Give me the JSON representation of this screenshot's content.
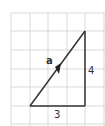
{
  "diagram": {
    "vector_label": "a",
    "vertical_leg_label": "4",
    "horizontal_leg_label": "3",
    "grid": {
      "cols": [
        11,
        30,
        48,
        67,
        85,
        104
      ],
      "rows": [
        13,
        31,
        50,
        69,
        87,
        106,
        124
      ],
      "color": "#d9d9d9"
    },
    "triangle": {
      "start": [
        30,
        106
      ],
      "corner": [
        85,
        106
      ],
      "end": [
        85,
        31
      ],
      "color": "#333333"
    }
  }
}
